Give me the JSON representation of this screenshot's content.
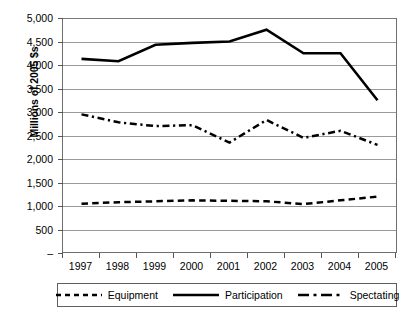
{
  "chart_data": {
    "type": "line",
    "title": "",
    "xlabel": "",
    "ylabel": "Millions of 2005 $s",
    "ylim": [
      0,
      5000
    ],
    "ytick_values": [
      0,
      500,
      1000,
      1500,
      2000,
      2500,
      3000,
      3500,
      4000,
      4500,
      5000
    ],
    "ytick_labels": [
      "–",
      "500",
      "1,000",
      "1,500",
      "2,000",
      "2,500",
      "3,000",
      "3,500",
      "4,000",
      "4,500",
      "5,000"
    ],
    "categories": [
      "1997",
      "1998",
      "1999",
      "2000",
      "2001",
      "2002",
      "2003",
      "2004",
      "2005"
    ],
    "x": [
      1997.5,
      1998.5,
      1999.5,
      2000.5,
      2001.5,
      2002.5,
      2003.5,
      2004.5,
      2005.5
    ],
    "xlim": [
      1997,
      2006
    ],
    "grid": "horizontal",
    "legend_position": "bottom",
    "series": [
      {
        "name": "Equipment",
        "style": "dashed",
        "values": [
          1050,
          1080,
          1100,
          1120,
          1110,
          1100,
          1040,
          1120,
          1200
        ]
      },
      {
        "name": "Participation",
        "style": "solid",
        "values": [
          4130,
          4080,
          4430,
          4470,
          4500,
          4750,
          4250,
          4250,
          3250
        ]
      },
      {
        "name": "Spectating",
        "style": "dash-dot",
        "values": [
          2950,
          2780,
          2700,
          2720,
          2350,
          2830,
          2450,
          2600,
          2300
        ]
      }
    ]
  },
  "legend": {
    "items": [
      {
        "label": "Equipment",
        "swatch": "dashed-line-swatch"
      },
      {
        "label": "Participation",
        "swatch": "solid-line-swatch"
      },
      {
        "label": "Spectating",
        "swatch": "dash-dot-line-swatch"
      }
    ]
  }
}
